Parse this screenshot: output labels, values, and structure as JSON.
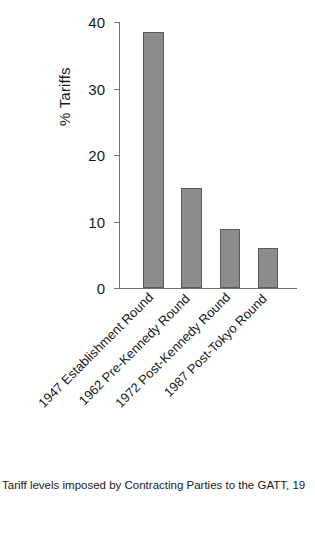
{
  "chart_data": {
    "type": "bar",
    "title": "",
    "xlabel": "",
    "ylabel": "% Tariffs",
    "categories": [
      "1947 Establishment Round",
      "1962 Pre-Kennedy Round",
      "1972 Post-Kennedy Round",
      "1987 Post-Tokyo Round"
    ],
    "values": [
      38.5,
      15,
      8.8,
      6
    ],
    "ylim": [
      0,
      40
    ],
    "yticks": [
      0,
      10,
      20,
      30,
      40
    ],
    "ytick_labels": [
      "0",
      "10",
      "20",
      "30",
      "40"
    ],
    "grid": false,
    "legend": false,
    "bar_color": "#8c8c8c",
    "bar_edge_color": "#5a5a5a",
    "axis_color": "#707070"
  },
  "caption": {
    "text": "Tariff levels imposed by Contracting Parties to the GATT, 19"
  }
}
